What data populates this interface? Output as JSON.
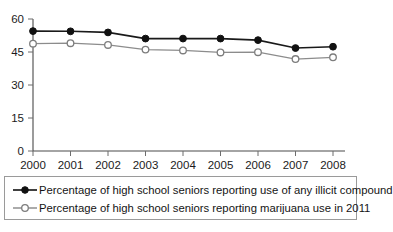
{
  "chart_data": {
    "type": "line",
    "title": "",
    "subtitle": "",
    "xlabel": "",
    "ylabel": "",
    "categories": [
      "2000",
      "2001",
      "2002",
      "2003",
      "2004",
      "2005",
      "2006",
      "2007",
      "2008"
    ],
    "x": [
      2000,
      2001,
      2002,
      2003,
      2004,
      2005,
      2006,
      2007,
      2008
    ],
    "xlim": [
      2000,
      2008
    ],
    "ylim": [
      0,
      60
    ],
    "yticks": [
      0,
      15,
      30,
      45,
      60
    ],
    "ytick_labels": [
      "0",
      "15",
      "30",
      "45",
      "60"
    ],
    "xtick_labels": [
      "2000",
      "2001",
      "2002",
      "2003",
      "2004",
      "2005",
      "2006",
      "2007",
      "2008"
    ],
    "grid": false,
    "legend_position": "below-plot",
    "series": [
      {
        "name": "Percentage of high school seniors reporting use of any illicit compound",
        "marker": "filled-circle",
        "color": "#111111",
        "values": [
          54.5,
          54.4,
          53.9,
          51.1,
          51.1,
          51.1,
          50.4,
          46.8,
          47.4
        ]
      },
      {
        "name": "Percentage of high school seniors reporting marijuana use in 2011",
        "marker": "open-circle",
        "color": "#7d7d7d",
        "values": [
          48.8,
          49.0,
          48.2,
          46.1,
          45.7,
          44.8,
          44.9,
          41.8,
          42.6
        ]
      }
    ]
  },
  "legend": {
    "items": [
      {
        "label": "Percentage of high school seniors reporting use of any illicit compound",
        "marker": "filled-circle"
      },
      {
        "label": "Percentage of high school seniors reporting marijuana use in 2011",
        "marker": "open-circle"
      }
    ]
  },
  "colors": {
    "series_illicit": "#111111",
    "series_marijuana": "#7d7d7d",
    "axis": "#4a4a4a",
    "legend_border": "#9a9a9a",
    "background": "#ffffff"
  }
}
